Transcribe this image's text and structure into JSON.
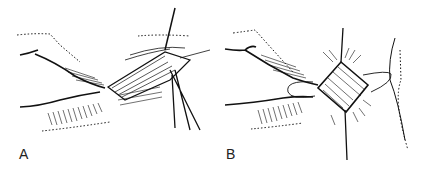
{
  "figure": {
    "panels": [
      {
        "label": "A",
        "description": "surgical illustration, retracted incision with instruments"
      },
      {
        "label": "B",
        "description": "surgical illustration, diamond-shaped wound closure with sutures"
      }
    ]
  }
}
